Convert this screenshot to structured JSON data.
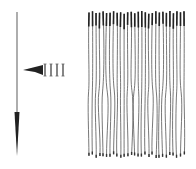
{
  "figure": {
    "stroke_color": "#555555",
    "dark_color": "#222222",
    "background": "#ffffff",
    "arrow": {
      "x": 17,
      "y_start": 12,
      "y_end": 156,
      "head_start": 112
    },
    "pointer": {
      "x_tip": 23,
      "y": 70,
      "x_end": 62,
      "marks": 4
    },
    "fibers": {
      "count": 28,
      "x_start": 89,
      "x_end": 184,
      "y_top": 11,
      "y_bottom": 158
    }
  }
}
